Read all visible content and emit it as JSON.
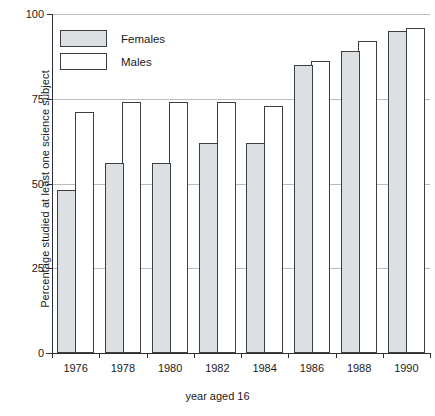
{
  "chart_data": {
    "type": "bar",
    "title": "",
    "xlabel": "year aged 16",
    "ylabel": "Percentage studied at least one science subject",
    "categories": [
      "1976",
      "1978",
      "1980",
      "1982",
      "1984",
      "1986",
      "1988",
      "1990"
    ],
    "series": [
      {
        "name": "Females",
        "values": [
          48,
          56,
          56,
          62,
          62,
          85,
          89,
          95
        ],
        "fill": "#dde0e2",
        "stroke": "#3a3f44"
      },
      {
        "name": "Males",
        "values": [
          71,
          74,
          74,
          74,
          73,
          86,
          92,
          96
        ],
        "fill": "#ffffff",
        "stroke": "#3a3f44"
      }
    ],
    "ylim": [
      0,
      100
    ],
    "yticks": [
      0,
      25,
      50,
      75,
      100
    ],
    "ytick_labels": [
      "0",
      "25",
      "50",
      "75",
      "100"
    ],
    "grid": true,
    "grid_color": "#b9bcbe",
    "legend_position": "top-left",
    "legend_entries": [
      "Females",
      "Males"
    ]
  }
}
